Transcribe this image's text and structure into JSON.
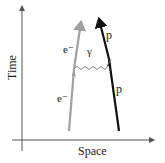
{
  "diagram": {
    "type": "feynman-diagram",
    "axes": {
      "y_label": "Time",
      "x_label": "Space"
    },
    "particles": {
      "electron_in_label": "e⁻",
      "electron_out_label": "e⁻",
      "photon_label": "γ",
      "proton_in_label": "p",
      "proton_out_label": "p"
    },
    "colors": {
      "axis": "#555555",
      "electron": "#a0a0a0",
      "proton": "#111111",
      "photon": "#777777",
      "text": "#222222"
    }
  }
}
